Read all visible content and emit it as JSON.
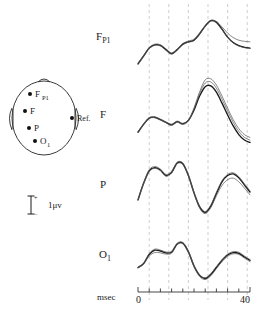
{
  "figure": {
    "title": "",
    "scalebar": {
      "unit": "1μv",
      "plus": "+",
      "minus": "−"
    }
  },
  "head_diagram": {
    "name": "head-schematic",
    "electrodes": [
      {
        "id": "fp1",
        "label": "F",
        "sub": "P1",
        "cx": 22,
        "cy": 16
      },
      {
        "id": "f",
        "label": "F",
        "sub": "",
        "cx": 17,
        "cy": 33
      },
      {
        "id": "p",
        "label": "P",
        "sub": "",
        "cx": 21,
        "cy": 50
      },
      {
        "id": "o1",
        "label": "O",
        "sub": "1",
        "cx": 27,
        "cy": 63
      }
    ],
    "reference": {
      "label": "Ref.",
      "cx": 56,
      "cy": 40
    }
  },
  "chart_data": {
    "type": "line",
    "title": "",
    "xlabel": "msec",
    "ylabel": "",
    "xlim": [
      0,
      40
    ],
    "ylim": [
      -1.6,
      2.6
    ],
    "grid": true,
    "grid_axis": "x",
    "gridlines_x": [
      4,
      11,
      18,
      25,
      32,
      39
    ],
    "legend": "none",
    "xticks": [
      0,
      4,
      8,
      12,
      16,
      20,
      24,
      28,
      32,
      36,
      40
    ],
    "xtick_labels": [
      "0",
      "",
      "",
      "",
      "",
      "",
      "",
      "",
      "",
      "",
      "40"
    ],
    "units": {
      "y": "1μv"
    },
    "panels": [
      {
        "name": "Fp1",
        "label": "F",
        "label_sub": "P1",
        "series": [
          {
            "name": "trial-1",
            "x": [
              0,
              2,
              4,
              6,
              8,
              10,
              12,
              14,
              16,
              18,
              20,
              22,
              24,
              26,
              28,
              30,
              32,
              34,
              36,
              38,
              40
            ],
            "y": [
              -0.95,
              -0.45,
              0.05,
              0.25,
              0.22,
              -0.05,
              -0.3,
              -0.05,
              0.3,
              0.45,
              0.55,
              0.95,
              1.45,
              1.8,
              1.7,
              1.25,
              0.75,
              0.4,
              0.2,
              0.1,
              0.05
            ]
          },
          {
            "name": "trial-2",
            "x": [
              0,
              2,
              4,
              6,
              8,
              10,
              12,
              14,
              16,
              18,
              20,
              22,
              24,
              26,
              28,
              30,
              32,
              34,
              36,
              38,
              40
            ],
            "y": [
              -1.0,
              -0.5,
              0.0,
              0.22,
              0.18,
              -0.1,
              -0.34,
              -0.08,
              0.26,
              0.42,
              0.52,
              0.92,
              1.42,
              1.76,
              1.66,
              1.22,
              0.72,
              0.38,
              0.18,
              0.08,
              0.02
            ]
          },
          {
            "name": "trial-3",
            "x": [
              0,
              2,
              4,
              6,
              8,
              10,
              12,
              14,
              16,
              18,
              20,
              22,
              24,
              26,
              28,
              30,
              32,
              34,
              36,
              38,
              40
            ],
            "y": [
              -0.9,
              -0.42,
              0.08,
              0.3,
              0.26,
              0.0,
              -0.26,
              0.0,
              0.34,
              0.5,
              0.62,
              1.02,
              1.5,
              1.82,
              1.74,
              1.4,
              1.0,
              0.72,
              0.55,
              0.48,
              0.45
            ]
          }
        ]
      },
      {
        "name": "F",
        "label": "F",
        "label_sub": "",
        "series": [
          {
            "name": "trial-1",
            "x": [
              0,
              2,
              4,
              6,
              8,
              10,
              12,
              14,
              16,
              18,
              20,
              22,
              24,
              26,
              28,
              30,
              32,
              34,
              36,
              38,
              40
            ],
            "y": [
              -0.85,
              -0.35,
              0.05,
              0.1,
              -0.05,
              -0.22,
              -0.38,
              -0.18,
              -0.32,
              -0.1,
              0.55,
              1.45,
              2.05,
              2.1,
              1.7,
              1.0,
              0.25,
              -0.45,
              -1.0,
              -1.35,
              -1.5
            ]
          },
          {
            "name": "trial-2",
            "x": [
              0,
              2,
              4,
              6,
              8,
              10,
              12,
              14,
              16,
              18,
              20,
              22,
              24,
              26,
              28,
              30,
              32,
              34,
              36,
              38,
              40
            ],
            "y": [
              -0.88,
              -0.38,
              0.02,
              0.07,
              -0.08,
              -0.25,
              -0.42,
              -0.22,
              -0.36,
              -0.14,
              0.62,
              1.6,
              2.28,
              2.35,
              1.95,
              1.25,
              0.5,
              -0.22,
              -0.8,
              -1.18,
              -1.35
            ]
          },
          {
            "name": "trial-3",
            "x": [
              0,
              2,
              4,
              6,
              8,
              10,
              12,
              14,
              16,
              18,
              20,
              22,
              24,
              26,
              28,
              30,
              32,
              34,
              36,
              38,
              40
            ],
            "y": [
              -0.82,
              -0.32,
              0.08,
              0.12,
              -0.02,
              -0.2,
              -0.34,
              -0.14,
              -0.28,
              -0.06,
              0.7,
              1.72,
              2.48,
              2.55,
              2.15,
              1.45,
              0.68,
              -0.05,
              -0.62,
              -1.0,
              -1.18
            ]
          }
        ]
      },
      {
        "name": "P",
        "label": "P",
        "label_sub": "",
        "series": [
          {
            "name": "trial-1",
            "x": [
              0,
              2,
              4,
              6,
              8,
              10,
              12,
              14,
              16,
              18,
              20,
              22,
              24,
              26,
              28,
              30,
              32,
              34,
              36,
              38,
              40
            ],
            "y": [
              -0.7,
              0.35,
              1.15,
              1.35,
              1.2,
              0.85,
              1.05,
              1.65,
              1.6,
              0.85,
              -0.25,
              -1.15,
              -1.5,
              -1.1,
              -0.3,
              0.45,
              0.85,
              0.95,
              0.7,
              0.25,
              -0.2
            ]
          },
          {
            "name": "trial-2",
            "x": [
              0,
              2,
              4,
              6,
              8,
              10,
              12,
              14,
              16,
              18,
              20,
              22,
              24,
              26,
              28,
              30,
              32,
              34,
              36,
              38,
              40
            ],
            "y": [
              -0.74,
              0.3,
              1.1,
              1.3,
              1.15,
              0.8,
              1.0,
              1.6,
              1.55,
              0.8,
              -0.3,
              -1.22,
              -1.58,
              -1.2,
              -0.45,
              0.22,
              0.58,
              0.68,
              0.45,
              0.05,
              -0.38
            ]
          },
          {
            "name": "trial-3",
            "x": [
              0,
              2,
              4,
              6,
              8,
              10,
              12,
              14,
              16,
              18,
              20,
              22,
              24,
              26,
              28,
              30,
              32,
              34,
              36,
              38,
              40
            ],
            "y": [
              -0.66,
              0.4,
              1.22,
              1.42,
              1.26,
              0.92,
              1.12,
              1.7,
              1.64,
              0.9,
              -0.2,
              -1.08,
              -1.44,
              -1.02,
              -0.22,
              0.52,
              0.92,
              1.02,
              0.78,
              0.32,
              -0.14
            ]
          }
        ]
      },
      {
        "name": "O1",
        "label": "O",
        "label_sub": "1",
        "series": [
          {
            "name": "trial-1",
            "x": [
              0,
              2,
              4,
              6,
              8,
              10,
              12,
              14,
              16,
              18,
              20,
              22,
              24,
              26,
              28,
              30,
              32,
              34,
              36,
              38,
              40
            ],
            "y": [
              -0.55,
              -0.3,
              0.28,
              0.55,
              0.5,
              0.38,
              0.42,
              0.95,
              1.0,
              0.45,
              -0.45,
              -1.05,
              -1.25,
              -1.0,
              -0.55,
              -0.1,
              0.25,
              0.4,
              0.35,
              0.12,
              -0.1
            ]
          },
          {
            "name": "trial-2",
            "x": [
              0,
              2,
              4,
              6,
              8,
              10,
              12,
              14,
              16,
              18,
              20,
              22,
              24,
              26,
              28,
              30,
              32,
              34,
              36,
              38,
              40
            ],
            "y": [
              -0.58,
              -0.34,
              0.18,
              0.4,
              0.38,
              0.3,
              0.36,
              0.9,
              0.96,
              0.38,
              -0.52,
              -1.12,
              -1.32,
              -1.08,
              -0.62,
              -0.18,
              0.16,
              0.32,
              0.28,
              0.05,
              -0.18
            ]
          },
          {
            "name": "trial-3",
            "x": [
              0,
              2,
              4,
              6,
              8,
              10,
              12,
              14,
              16,
              18,
              20,
              22,
              24,
              26,
              28,
              30,
              32,
              34,
              36,
              38,
              40
            ],
            "y": [
              -0.52,
              -0.26,
              0.34,
              0.62,
              0.56,
              0.44,
              0.48,
              1.0,
              1.04,
              0.5,
              -0.4,
              -1.0,
              -1.2,
              -0.94,
              -0.48,
              -0.04,
              0.3,
              0.46,
              0.42,
              0.18,
              -0.04
            ]
          }
        ]
      }
    ]
  },
  "colors": {
    "trace": "#1a1a1a",
    "trace_light": "#555555",
    "grid": "#b9b9b9",
    "axis": "#333333",
    "head_outline": "#3a3a3a"
  }
}
